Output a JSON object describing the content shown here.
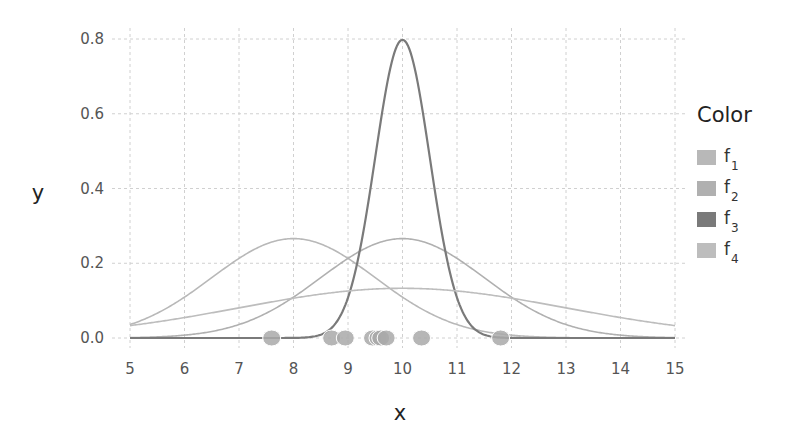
{
  "chart_data": {
    "type": "line",
    "title": "",
    "xlabel": "x",
    "ylabel": "y",
    "xlim": [
      5,
      15
    ],
    "ylim": [
      0,
      0.8
    ],
    "x_ticks": [
      "5",
      "6",
      "7",
      "8",
      "9",
      "10",
      "11",
      "12",
      "13",
      "14",
      "15"
    ],
    "y_ticks": [
      "0.0",
      "0.2",
      "0.4",
      "0.6",
      "0.8"
    ],
    "grid": true,
    "legend": {
      "title": "Color",
      "position": "right",
      "entries": [
        "f1",
        "f2",
        "f3",
        "f4"
      ]
    },
    "series": [
      {
        "name": "f1",
        "kind": "normal_pdf",
        "mean": 8,
        "sd": 1.5,
        "peak": 0.266,
        "color": "#b8b8b8"
      },
      {
        "name": "f2",
        "kind": "normal_pdf",
        "mean": 10,
        "sd": 1.5,
        "peak": 0.266,
        "color": "#b0b0b0"
      },
      {
        "name": "f3",
        "kind": "normal_pdf",
        "mean": 10,
        "sd": 0.5,
        "peak": 0.798,
        "color": "#7a7a7a"
      },
      {
        "name": "f4",
        "kind": "normal_pdf",
        "mean": 10,
        "sd": 3,
        "peak": 0.133,
        "color": "#bdbdbd"
      }
    ],
    "points": {
      "y": 0,
      "x": [
        7.6,
        8.7,
        8.95,
        9.45,
        9.55,
        9.6,
        9.7,
        10.35,
        11.8
      ],
      "color": "#a9a9a9"
    }
  },
  "axes": {
    "x_title": "x",
    "y_title": "y"
  },
  "legend": {
    "title": "Color",
    "items": [
      {
        "base": "f",
        "sub": "1",
        "color": "#b8b8b8"
      },
      {
        "base": "f",
        "sub": "2",
        "color": "#b0b0b0"
      },
      {
        "base": "f",
        "sub": "3",
        "color": "#7a7a7a"
      },
      {
        "base": "f",
        "sub": "4",
        "color": "#bdbdbd"
      }
    ]
  }
}
